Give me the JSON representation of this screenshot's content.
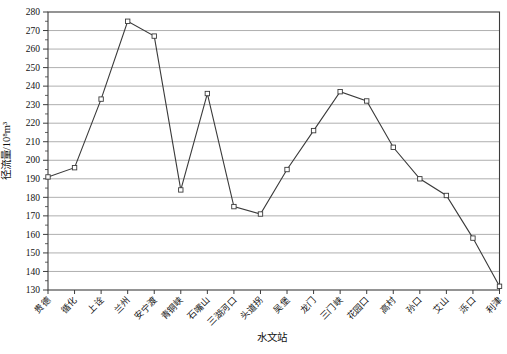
{
  "chart_data": {
    "type": "line",
    "title": "",
    "xlabel": "水文站",
    "ylabel": "径流量/10⁸m³",
    "categories": [
      "贵德",
      "循化",
      "上诠",
      "兰州",
      "安宁渡",
      "青铜峡",
      "石嘴山",
      "三湖河口",
      "头道拐",
      "吴堡",
      "龙门",
      "三门峡",
      "花园口",
      "高村",
      "孙口",
      "艾山",
      "泺口",
      "利津"
    ],
    "values": [
      191,
      196,
      233,
      275,
      267,
      184,
      236,
      175,
      171,
      195,
      216,
      237,
      232,
      207,
      190,
      181,
      158,
      132
    ],
    "ylim": [
      130,
      280
    ],
    "ytick_step": 10,
    "ytick_labels": [
      "130",
      "140",
      "150",
      "160",
      "170",
      "180",
      "190",
      "200",
      "210",
      "220",
      "230",
      "240",
      "250",
      "260",
      "270",
      "280"
    ],
    "grid": "horizontal",
    "legend": "none",
    "marker": "open-square",
    "colors": {
      "line": "#3a3a3a",
      "marker_fill": "#ffffff",
      "grid": "#9a9a9a",
      "frame": "#3c3c3c",
      "text": "#111111",
      "background": "#ffffff"
    }
  }
}
